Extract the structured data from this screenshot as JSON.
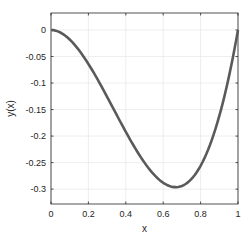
{
  "chart_data": {
    "type": "line",
    "title": "",
    "xlabel": "x",
    "ylabel": "y(x)",
    "xlim": [
      0,
      1
    ],
    "ylim": [
      -0.328,
      0.032
    ],
    "xticks": [
      "0",
      "0.2",
      "0.4",
      "0.6",
      "0.8",
      "1"
    ],
    "yticks": [
      "0",
      "-0.05",
      "-0.1",
      "-0.15",
      "-0.2",
      "-0.25",
      "-0.3"
    ],
    "grid": true,
    "legend": null,
    "series": [
      {
        "name": "y(x)",
        "color": "#5a5a5a",
        "x": [
          0,
          0.05,
          0.1,
          0.15,
          0.2,
          0.25,
          0.3,
          0.35,
          0.4,
          0.45,
          0.5,
          0.55,
          0.6,
          0.65,
          0.667,
          0.7,
          0.75,
          0.8,
          0.85,
          0.9,
          0.95,
          1.0
        ],
        "y": [
          0,
          -0.0048,
          -0.018,
          -0.0383,
          -0.064,
          -0.0938,
          -0.126,
          -0.1593,
          -0.192,
          -0.2228,
          -0.25,
          -0.2723,
          -0.288,
          -0.2958,
          -0.2963,
          -0.294,
          -0.2813,
          -0.256,
          -0.2168,
          -0.162,
          -0.0903,
          0.0
        ]
      }
    ]
  }
}
